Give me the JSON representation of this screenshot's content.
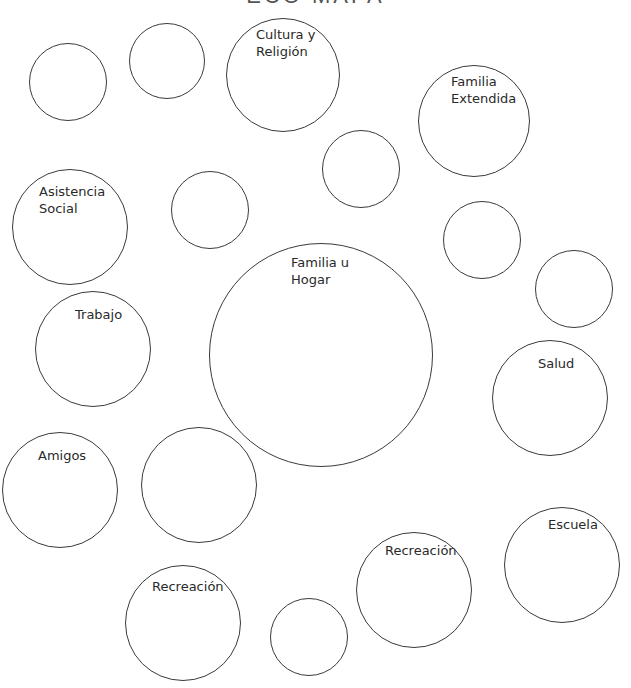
{
  "title": "ECO MAPA",
  "styles": {
    "stroke": "#3a3a3a",
    "text": "#2a2a2a",
    "background": "#ffffff"
  },
  "circles": [
    {
      "id": "blank-1",
      "label": "",
      "cx": 68,
      "cy": 82,
      "r": 39
    },
    {
      "id": "blank-2",
      "label": "",
      "cx": 167,
      "cy": 61,
      "r": 38
    },
    {
      "id": "cultura-religion",
      "label": "Cultura y\nReligión",
      "cx": 283,
      "cy": 75,
      "r": 57,
      "lx": 256,
      "ly": 26
    },
    {
      "id": "familia-extendida",
      "label": "Familia\nExtendida",
      "cx": 474,
      "cy": 121,
      "r": 56,
      "lx": 451,
      "ly": 73
    },
    {
      "id": "blank-3",
      "label": "",
      "cx": 361,
      "cy": 169,
      "r": 39
    },
    {
      "id": "asistencia-social",
      "label": "Asistencia\nSocial",
      "cx": 70,
      "cy": 227,
      "r": 58,
      "lx": 39,
      "ly": 183
    },
    {
      "id": "blank-4",
      "label": "",
      "cx": 210,
      "cy": 210,
      "r": 39
    },
    {
      "id": "blank-5",
      "label": "",
      "cx": 482,
      "cy": 240,
      "r": 39
    },
    {
      "id": "blank-6",
      "label": "",
      "cx": 574,
      "cy": 289,
      "r": 39
    },
    {
      "id": "familia-hogar",
      "label": "Familia u\nHogar",
      "cx": 321,
      "cy": 355,
      "r": 112,
      "lx": 291,
      "ly": 254
    },
    {
      "id": "trabajo",
      "label": "Trabajo",
      "cx": 93,
      "cy": 349,
      "r": 58,
      "lx": 75,
      "ly": 306
    },
    {
      "id": "salud",
      "label": "Salud",
      "cx": 550,
      "cy": 398,
      "r": 58,
      "lx": 538,
      "ly": 355
    },
    {
      "id": "amigos",
      "label": "Amigos",
      "cx": 60,
      "cy": 490,
      "r": 58,
      "lx": 38,
      "ly": 447
    },
    {
      "id": "blank-7",
      "label": "",
      "cx": 199,
      "cy": 485,
      "r": 58
    },
    {
      "id": "escuela",
      "label": "Escuela",
      "cx": 562,
      "cy": 565,
      "r": 58,
      "lx": 548,
      "ly": 516
    },
    {
      "id": "recreacion-right",
      "label": "Recreación",
      "cx": 414,
      "cy": 590,
      "r": 58,
      "lx": 385,
      "ly": 542
    },
    {
      "id": "recreacion-left",
      "label": "Recreación",
      "cx": 183,
      "cy": 623,
      "r": 58,
      "lx": 152,
      "ly": 578
    },
    {
      "id": "blank-8",
      "label": "",
      "cx": 309,
      "cy": 637,
      "r": 39
    }
  ]
}
